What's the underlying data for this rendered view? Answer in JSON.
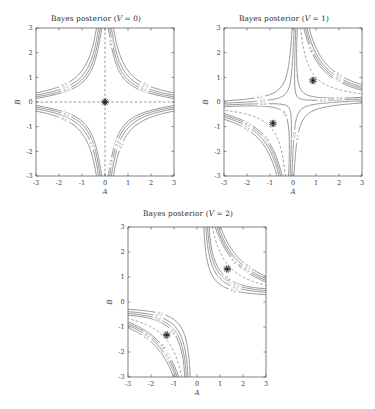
{
  "figure": {
    "background": "#ffffff",
    "panel_count": 3,
    "line_color": "#555555",
    "axis_color": "#4a4a4a",
    "marker_color": "#1c1c1c"
  },
  "panels": [
    {
      "id": "panel-v0",
      "title": "Bayes posterior (V = 0)",
      "title_prefix": "Bayes posterior (",
      "title_var": "V",
      "title_suffix": " = 0)",
      "V": 0,
      "xlabel": "A",
      "ylabel": "B",
      "xlim": [
        -3,
        3
      ],
      "ylim": [
        -3,
        3
      ],
      "xticks": [
        -3,
        -2,
        -1,
        0,
        1,
        2,
        3
      ],
      "yticks": [
        -3,
        -2,
        -1,
        0,
        1,
        2,
        3
      ],
      "xticklabels": [
        "-3",
        "-2",
        "-1",
        "0",
        "1",
        "2",
        "3"
      ],
      "yticklabels": [
        "-3",
        "-2",
        "-1",
        "0",
        "1",
        "2",
        "3"
      ],
      "markers": [
        [
          0,
          0
        ]
      ],
      "contour_levels": [
        0.1,
        0.2,
        0.3,
        0.4
      ],
      "contour_labels": [
        "0.1",
        "0.2",
        "0.3",
        "0.4"
      ],
      "ridge_description": "dashed lines A=0 and B=0"
    },
    {
      "id": "panel-v1",
      "title": "Bayes posterior (V = 1)",
      "title_prefix": "Bayes posterior (",
      "title_var": "V",
      "title_suffix": " = 1)",
      "V": 1,
      "xlabel": "A",
      "ylabel": "B",
      "xlim": [
        -3,
        3
      ],
      "ylim": [
        -3,
        3
      ],
      "xticks": [
        -3,
        -2,
        -1,
        0,
        1,
        2,
        3
      ],
      "yticks": [
        -3,
        -2,
        -1,
        0,
        1,
        2,
        3
      ],
      "xticklabels": [
        "-3",
        "-2",
        "-1",
        "0",
        "1",
        "2",
        "3"
      ],
      "yticklabels": [
        "-3",
        "-2",
        "-1",
        "0",
        "1",
        "2",
        "3"
      ],
      "markers": [
        [
          0.87,
          0.87
        ],
        [
          -0.87,
          -0.87
        ]
      ],
      "contour_levels": [
        0.1,
        0.2,
        0.3,
        0.4
      ],
      "contour_labels": [
        "0.1",
        "0.2",
        "0.3",
        "0.4"
      ],
      "ridge_description": "dashed hyperbola A*B = 1"
    },
    {
      "id": "panel-v2",
      "title": "Bayes posterior (V = 2)",
      "title_prefix": "Bayes posterior (",
      "title_var": "V",
      "title_suffix": " = 2)",
      "V": 2,
      "xlabel": "A",
      "ylabel": "B",
      "xlim": [
        -3,
        3
      ],
      "ylim": [
        -3,
        3
      ],
      "xticks": [
        -3,
        -2,
        -1,
        0,
        1,
        2,
        3
      ],
      "yticks": [
        -3,
        -2,
        -1,
        0,
        1,
        2,
        3
      ],
      "xticklabels": [
        "-3",
        "-2",
        "-1",
        "0",
        "1",
        "2",
        "3"
      ],
      "yticklabels": [
        "-3",
        "-2",
        "-1",
        "0",
        "1",
        "2",
        "3"
      ],
      "markers": [
        [
          1.32,
          1.32
        ],
        [
          -1.32,
          -1.32
        ]
      ],
      "contour_levels": [
        0.1,
        0.2,
        0.3,
        0.4
      ],
      "contour_labels": [
        "0.1",
        "0.2",
        "0.3",
        "0.4"
      ],
      "ridge_description": "dashed hyperbola A*B = 2"
    }
  ],
  "chart_data": {
    "type": "line",
    "subtype": "contour",
    "xlabel": "A",
    "ylabel": "B",
    "xlim": [
      -3,
      3
    ],
    "ylim": [
      -3,
      3
    ],
    "grid": false,
    "legend": "none",
    "levels": [
      0.1,
      0.2,
      0.3,
      0.4
    ],
    "level_labels": [
      "0.1",
      "0.2",
      "0.3",
      "0.4"
    ],
    "series": [
      {
        "name": "Bayes posterior (V = 0)",
        "V": 0,
        "modes": [
          [
            0,
            0
          ]
        ],
        "ridge": "A*B = 0",
        "contour_extent_on_axes": {
          "level_0.4": 1.5,
          "level_0.3": 2.35,
          "level_0.2": 2.9
        }
      },
      {
        "name": "Bayes posterior (V = 1)",
        "V": 1,
        "modes": [
          [
            0.87,
            0.87
          ],
          [
            -0.87,
            -0.87
          ]
        ],
        "ridge": "A*B = 1",
        "contour_extent_on_axes": {
          "saddle_crossing": 0.35,
          "level_0.3_inner_loop_radius": 0.55
        }
      },
      {
        "name": "Bayes posterior (V = 2)",
        "V": 2,
        "modes": [
          [
            1.32,
            1.32
          ],
          [
            -1.32,
            -1.32
          ]
        ],
        "ridge": "A*B = 2",
        "contour_extent_on_axes": {
          "mode_value": 1.32
        }
      }
    ]
  }
}
